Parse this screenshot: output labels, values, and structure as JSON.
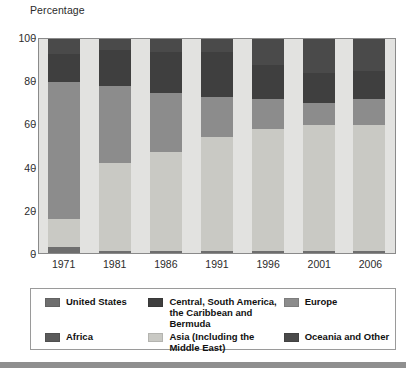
{
  "axis_title": "Percentage",
  "colors": {
    "united_states": "#6e6e6e",
    "central_south_america": "#3f3f3f",
    "europe": "#8c8c8c",
    "africa": "#5a5a5a",
    "asia": "#c9c9c4",
    "oceania_other": "#4a4a4a",
    "plot_background": "#e2e2e0",
    "frame": "#8a8a8a"
  },
  "legend": {
    "rows": [
      [
        {
          "label": "United States",
          "key": "united_states"
        },
        {
          "label": "Central, South America, the Caribbean and Bermuda",
          "key": "central_south_america"
        },
        {
          "label": "Europe",
          "key": "europe"
        }
      ],
      [
        {
          "label": "Africa",
          "key": "africa"
        },
        {
          "label": "Asia (Including the Middle East)",
          "key": "asia"
        },
        {
          "label": "Oceania and Other",
          "key": "oceania_other"
        }
      ]
    ]
  },
  "chart_data": {
    "type": "bar",
    "stacked": true,
    "stack_mode": "percent",
    "title": "",
    "subtitle": "",
    "xlabel": "",
    "ylabel": "Percentage",
    "ylim": [
      0,
      100
    ],
    "yticks": [
      0,
      20,
      40,
      60,
      80,
      100
    ],
    "ytick_labels": [
      "0",
      "20",
      "40",
      "60",
      "80",
      "100"
    ],
    "grid": false,
    "legend_position": "bottom",
    "categories": [
      "1971",
      "1981",
      "1986",
      "1991",
      "1996",
      "2001",
      "2006"
    ],
    "series": [
      {
        "name": "Asia (Including the Middle East)",
        "key": "asia",
        "values": [
          0,
          0,
          0,
          0,
          0,
          0,
          0
        ]
      },
      {
        "name": "United States",
        "key": "united_states",
        "values": [
          3,
          1,
          1,
          0,
          0,
          0,
          0
        ]
      },
      {
        "name": "Africa",
        "key": "africa",
        "values": [
          0,
          0,
          0,
          0,
          0,
          0,
          0
        ]
      },
      {
        "name": "Europe",
        "key": "europe",
        "values": [
          0,
          0,
          0,
          0,
          0,
          0,
          0
        ]
      }
    ],
    "stack_order_bottom_to_top": [
      "united_states_base",
      "asia",
      "europe",
      "central_south_america",
      "oceania_other"
    ],
    "bars": [
      {
        "category": "1971",
        "segments": [
          {
            "key": "united_states",
            "name": "United States",
            "value": 3
          },
          {
            "key": "asia",
            "name": "Asia (Including the Middle East)",
            "value": 13
          },
          {
            "key": "europe",
            "name": "Europe",
            "value": 64
          },
          {
            "key": "central_south_america",
            "name": "Central, South America, the Caribbean and Bermuda",
            "value": 13
          },
          {
            "key": "oceania_other",
            "name": "Oceania and Other",
            "value": 7
          }
        ]
      },
      {
        "category": "1981",
        "segments": [
          {
            "key": "united_states",
            "name": "United States",
            "value": 1
          },
          {
            "key": "asia",
            "name": "Asia (Including the Middle East)",
            "value": 41
          },
          {
            "key": "europe",
            "name": "Europe",
            "value": 36
          },
          {
            "key": "central_south_america",
            "name": "Central, South America, the Caribbean and Bermuda",
            "value": 17
          },
          {
            "key": "oceania_other",
            "name": "Oceania and Other",
            "value": 5
          }
        ]
      },
      {
        "category": "1986",
        "segments": [
          {
            "key": "united_states",
            "name": "United States",
            "value": 1
          },
          {
            "key": "asia",
            "name": "Asia (Including the Middle East)",
            "value": 46
          },
          {
            "key": "europe",
            "name": "Europe",
            "value": 28
          },
          {
            "key": "central_south_america",
            "name": "Central, South America, the Caribbean and Bermuda",
            "value": 19
          },
          {
            "key": "oceania_other",
            "name": "Oceania and Other",
            "value": 6
          }
        ]
      },
      {
        "category": "1991",
        "segments": [
          {
            "key": "united_states",
            "name": "United States",
            "value": 1
          },
          {
            "key": "asia",
            "name": "Asia (Including the Middle East)",
            "value": 53
          },
          {
            "key": "europe",
            "name": "Europe",
            "value": 19
          },
          {
            "key": "central_south_america",
            "name": "Central, South America, the Caribbean and Bermuda",
            "value": 21
          },
          {
            "key": "oceania_other",
            "name": "Oceania and Other",
            "value": 6
          }
        ]
      },
      {
        "category": "1996",
        "segments": [
          {
            "key": "united_states",
            "name": "United States",
            "value": 1
          },
          {
            "key": "asia",
            "name": "Asia (Including the Middle East)",
            "value": 57
          },
          {
            "key": "europe",
            "name": "Europe",
            "value": 14
          },
          {
            "key": "central_south_america",
            "name": "Central, South America, the Caribbean and Bermuda",
            "value": 16
          },
          {
            "key": "oceania_other",
            "name": "Oceania and Other",
            "value": 12
          }
        ]
      },
      {
        "category": "2001",
        "segments": [
          {
            "key": "united_states",
            "name": "United States",
            "value": 1
          },
          {
            "key": "asia",
            "name": "Asia (Including the Middle East)",
            "value": 59
          },
          {
            "key": "europe",
            "name": "Europe",
            "value": 10
          },
          {
            "key": "central_south_america",
            "name": "Central, South America, the Caribbean and Bermuda",
            "value": 14
          },
          {
            "key": "oceania_other",
            "name": "Oceania and Other",
            "value": 16
          }
        ]
      },
      {
        "category": "2006",
        "segments": [
          {
            "key": "united_states",
            "name": "United States",
            "value": 1
          },
          {
            "key": "asia",
            "name": "Asia (Including the Middle East)",
            "value": 59
          },
          {
            "key": "europe",
            "name": "Europe",
            "value": 12
          },
          {
            "key": "central_south_america",
            "name": "Central, South America, the Caribbean and Bermuda",
            "value": 13
          },
          {
            "key": "oceania_other",
            "name": "Oceania and Other",
            "value": 15
          }
        ]
      }
    ]
  }
}
